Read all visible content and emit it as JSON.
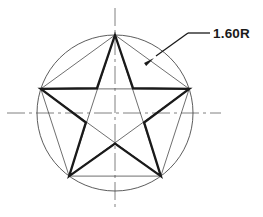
{
  "drawing": {
    "title": "Star inscribed in circle — radius dimension drawing",
    "background_color": "#ffffff",
    "canvas": {
      "width": 263,
      "height": 217
    }
  },
  "geometry": {
    "circle": {
      "name": "construction-circle",
      "center_x": 115,
      "center_y": 113,
      "radius": 78,
      "stroke_color": "#4a4a4a",
      "stroke_width": 0.9
    },
    "star": {
      "name": "five-point-star",
      "points": 5,
      "outer_radius": 78,
      "inner_radius": 30.6,
      "rotation_deg": -90,
      "stroke_color": "#1a1a1a",
      "stroke_width": 2.3,
      "fill": "none"
    },
    "pentagon_chords": {
      "name": "construction-chords",
      "stroke_color": "#4a4a4a",
      "stroke_width": 0.8,
      "description": "thin lines joining the five outer vertices and the internal pentagram diagonals"
    },
    "centerlines": {
      "name": "center-lines",
      "stroke_color": "#808080",
      "stroke_width": 1.0,
      "dash_pattern": "18 4 3 4",
      "horizontal": {
        "x1": 7,
        "y1": 113,
        "x2": 221,
        "y2": 113
      },
      "vertical": {
        "x1": 115,
        "y1": 8,
        "x2": 115,
        "y2": 210
      }
    }
  },
  "annotation": {
    "radius_dimension": {
      "name": "radius-dimension-label",
      "text": "1.60R",
      "value": 1.6,
      "symbol": "R",
      "text_x": 213,
      "text_y": 27,
      "color": "#1a1a1a"
    },
    "leader": {
      "name": "leader-line",
      "stroke_color": "#1a1a1a",
      "stroke_width": 1.3,
      "shoulder": {
        "x1": 210,
        "y1": 33,
        "x2": 188,
        "y2": 33
      },
      "slant": {
        "x1": 188,
        "y1": 33,
        "x2": 156,
        "y2": 56
      },
      "arrow_tip_x": 154,
      "arrow_tip_y": 58,
      "arrow_angle_deg": 144,
      "arrow_length": 11,
      "arrow_width": 3.6
    }
  },
  "chart_data": {
    "type": "diagram",
    "title": "1.60R",
    "annotations": [
      {
        "label": "1.60R",
        "target": "circle outer edge",
        "leader": true
      }
    ],
    "entities": [
      {
        "kind": "circle",
        "radius": 1.6,
        "center": [
          0,
          0
        ]
      },
      {
        "kind": "star",
        "points": 5,
        "circumscribed_radius": 1.6
      },
      {
        "kind": "centerline",
        "orientation": "horizontal"
      },
      {
        "kind": "centerline",
        "orientation": "vertical"
      }
    ]
  }
}
